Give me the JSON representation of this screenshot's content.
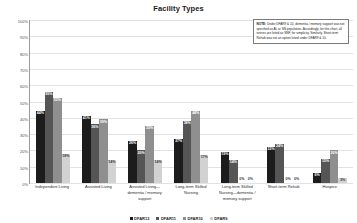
{
  "chart_data": {
    "type": "bar",
    "title": "Facility Types",
    "xlabel": "",
    "ylabel": "Percentage of Submissions",
    "ylim": [
      0,
      100
    ],
    "ytick_labels": [
      "100%",
      "90%",
      "80%",
      "70%",
      "60%",
      "50%",
      "40%",
      "30%",
      "20%",
      "10%",
      "0%"
    ],
    "ytick_values": [
      100,
      90,
      80,
      70,
      60,
      50,
      40,
      30,
      20,
      10,
      0
    ],
    "grid": true,
    "legend_position": "bottom",
    "categories": [
      "Independent Living",
      "Assisted Living",
      "Assisted Living—dementia / memory support",
      "Long-term Skilled Nursing",
      "Long-term Skilled Nursing—dementia / memory support",
      "Short-term Rehab",
      "Hospice"
    ],
    "series": [
      {
        "name": "DFAR12",
        "color": "#1c1c1c",
        "values": [
          44,
          41,
          26,
          27,
          19,
          22,
          6
        ],
        "labels": [
          "44%",
          "41%",
          "26%",
          "27%",
          "19%",
          "22%",
          "6%"
        ]
      },
      {
        "name": "DFAR11",
        "color": "#555555",
        "values": [
          56,
          36,
          20,
          38,
          14,
          24,
          15
        ],
        "labels": [
          "56%",
          "36%",
          "20%",
          "38%",
          "14%",
          "24%",
          "15%"
        ]
      },
      {
        "name": "DFAR10",
        "color": "#8f8f8f",
        "values": [
          52,
          39,
          35,
          44,
          0,
          0,
          20
        ],
        "labels": [
          "52%",
          "39%",
          "35%",
          "44%",
          "0%",
          "0%",
          "20%"
        ]
      },
      {
        "name": "DFAR9",
        "color": "#d2d2d2",
        "values": [
          18,
          14,
          14,
          17,
          0,
          0,
          3
        ],
        "labels": [
          "18%",
          "14%",
          "14%",
          "17%",
          "0%",
          "0%",
          "3%"
        ]
      }
    ],
    "annotation": {
      "prefix": "NOTE:",
      "text": " Under DFAR9 & 10, dementia / memory support was not specified as AL or SN population. Accordingly, for this chart, all entries are listed as SNF, for simplicity. Similarly, Short-term Rehab was not an option listed under DFAR9 & 10."
    }
  }
}
